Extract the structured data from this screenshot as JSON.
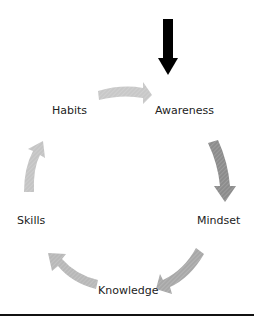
{
  "diagram": {
    "type": "cycle",
    "nodes": [
      {
        "id": "awareness",
        "label": "Awareness"
      },
      {
        "id": "mindset",
        "label": "Mindset"
      },
      {
        "id": "knowledge",
        "label": "Knowledge"
      },
      {
        "id": "skills",
        "label": "Skills"
      },
      {
        "id": "habits",
        "label": "Habits"
      }
    ],
    "edges": [
      {
        "from": "habits",
        "to": "awareness",
        "color": "#c8c8c8"
      },
      {
        "from": "awareness",
        "to": "mindset",
        "color": "#8c8c8c"
      },
      {
        "from": "mindset",
        "to": "knowledge",
        "color": "#a8a8a8"
      },
      {
        "from": "knowledge",
        "to": "skills",
        "color": "#b8b8b8"
      },
      {
        "from": "skills",
        "to": "habits",
        "color": "#c4c4c4"
      }
    ],
    "entry_arrow": {
      "target": "awareness",
      "color": "#000000"
    }
  }
}
